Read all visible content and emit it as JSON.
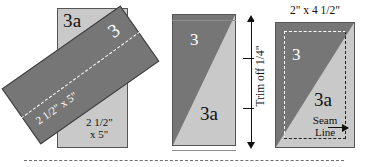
{
  "diagram": {
    "colors": {
      "dark_fabric": "#767676",
      "light_fabric": "#c9c9c9",
      "outline": "#555555",
      "stitch_line": "#ffffff",
      "text": "#111111"
    },
    "steps": [
      {
        "id": "step-1-place",
        "labels": {
          "base_piece": "3a",
          "base_size_line1": "2 1/2\"",
          "base_size_line2": "x 5\"",
          "strip_piece": "3",
          "strip_size": "2 1/2\" x 5\"",
          "stitch_line_name": "sewing-line"
        }
      },
      {
        "id": "step-2-trim",
        "labels": {
          "dark_piece": "3",
          "light_piece": "3a",
          "dimension": "Trim off 1/4\""
        }
      },
      {
        "id": "step-3-finished",
        "labels": {
          "size": "2\" x 4 1/2\"",
          "dark_piece": "3",
          "light_piece": "3a",
          "seam_line_1": "Seam",
          "seam_line_2": "Line"
        }
      }
    ]
  }
}
